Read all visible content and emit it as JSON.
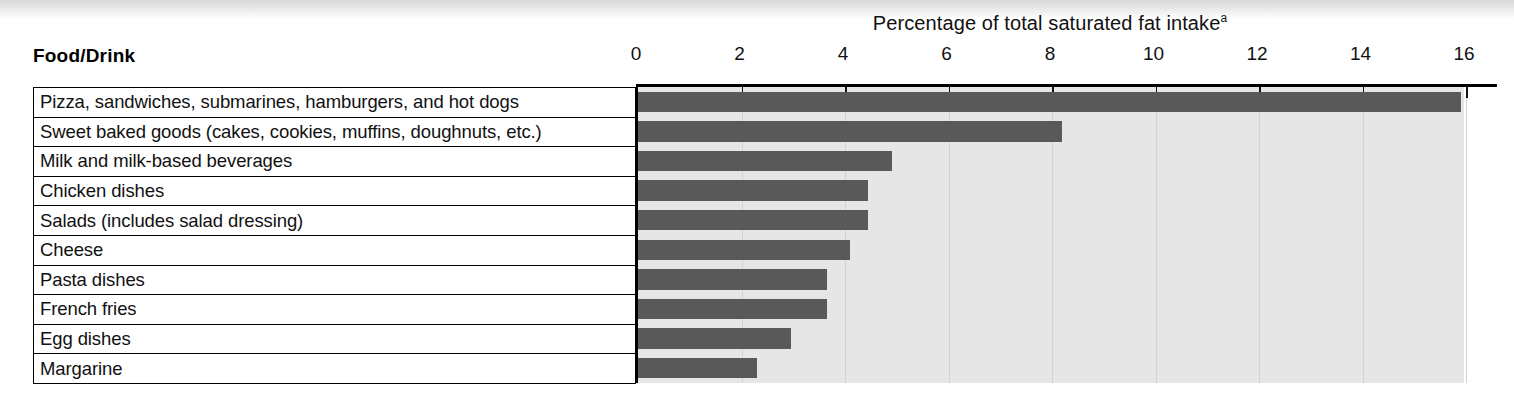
{
  "figure": {
    "column_header": "Food/Drink",
    "axis_title": "Percentage of total saturated fat intake",
    "axis_title_superscript": "a",
    "bar_color": "#595959",
    "plot_background": "#e6e6e6"
  },
  "chart_data": {
    "type": "bar",
    "orientation": "horizontal",
    "title": "Percentage of total saturated fat intake",
    "xlabel": "Percentage of total saturated fat intake",
    "ylabel": "Food/Drink",
    "xlim": [
      0,
      16
    ],
    "xticks": [
      0,
      2,
      4,
      6,
      8,
      10,
      12,
      14,
      16
    ],
    "xticklabels": [
      "0",
      "2",
      "4",
      "6",
      "8",
      "10",
      "12",
      "14",
      "16"
    ],
    "grid": true,
    "legend": false,
    "categories": [
      "Pizza, sandwiches, submarines, hamburgers, and hot dogs",
      "Sweet baked goods (cakes, cookies, muffins, doughnuts, etc.)",
      "Milk and milk-based beverages",
      "Chicken dishes",
      "Salads (includes salad dressing)",
      "Cheese",
      "Pasta dishes",
      "French fries",
      "Egg dishes",
      "Margarine"
    ],
    "values": [
      15.9,
      8.2,
      4.9,
      4.45,
      4.45,
      4.1,
      3.65,
      3.65,
      2.95,
      2.3
    ],
    "series": [
      {
        "name": "Percentage of total saturated fat intake",
        "values": [
          15.9,
          8.2,
          4.9,
          4.45,
          4.45,
          4.1,
          3.65,
          3.65,
          2.95,
          2.3
        ]
      }
    ]
  }
}
